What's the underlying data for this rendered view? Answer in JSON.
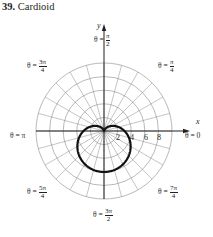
{
  "title": {
    "number": "39.",
    "text": "Cardioid"
  },
  "chart_data": {
    "type": "polar",
    "title": "Cardioid",
    "curve": "r = a(1 - sin θ)",
    "grid": {
      "circles": [
        2,
        4,
        6,
        8,
        10
      ],
      "rays_every_deg": 15
    },
    "radial_tick_labels": [
      "2",
      "4",
      "6",
      "8"
    ],
    "angle_labels": [
      "θ = π/2",
      "θ = π/4",
      "θ = 3π/4",
      "θ = π",
      "θ = 0",
      "θ = 5π/4",
      "θ = 7π/4",
      "θ = 3π/2"
    ],
    "axes": {
      "x": "x",
      "y": "y"
    }
  },
  "axes": {
    "x_label": "x",
    "y_label": "y"
  },
  "ticks": [
    "2",
    "4",
    "6",
    "8"
  ],
  "angles": {
    "pi_half": {
      "prefix": "θ =",
      "num": "π",
      "den": "2"
    },
    "pi_quarter": {
      "prefix": "θ =",
      "num": "π",
      "den": "4"
    },
    "three_pi_quarter": {
      "prefix": "θ =",
      "num": "3π",
      "den": "4"
    },
    "pi": {
      "text": "θ = π"
    },
    "zero": {
      "text": "θ = 0"
    },
    "five_pi_quarter": {
      "prefix": "θ =",
      "num": "5π",
      "den": "4"
    },
    "seven_pi_quarter": {
      "prefix": "θ =",
      "num": "7π",
      "den": "4"
    },
    "three_pi_half": {
      "prefix": "θ =",
      "num": "3π",
      "den": "2"
    }
  }
}
